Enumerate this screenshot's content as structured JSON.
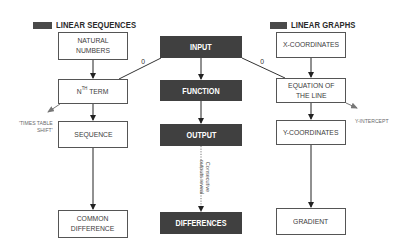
{
  "legend": {
    "left": {
      "label": "LINEAR SEQUENCES",
      "swatch_color": "#4a4a4a"
    },
    "right": {
      "label": "LINEAR GRAPHS",
      "swatch_color": "#4a4a4a"
    }
  },
  "colors": {
    "dark_box": "#404040",
    "line": "#222222",
    "light_border": "#555555",
    "annotation_text": "#6a6a6a"
  },
  "left_column": {
    "natural_numbers": "NATURAL\nNUMBERS",
    "nth_term_prefix": "N",
    "nth_term_sup": "TH",
    "nth_term_suffix": " TERM",
    "sequence": "SEQUENCE",
    "common_difference": "COMMON\nDIFFERENCE",
    "times_table_shift": "'TIMES TABLE\nSHIFT'"
  },
  "center_column": {
    "input": "INPUT",
    "function": "FUNCTION",
    "output": "OUTPUT",
    "differences": "DIFFERENCES",
    "consecutive_note": "Consecutive\noutputs reveal"
  },
  "right_column": {
    "x_coordinates": "X-COORDINATES",
    "equation_of_line": "EQUATION OF\nTHE LINE",
    "y_coordinates": "Y-COORDINATES",
    "gradient": "GRADIENT",
    "y_intercept": "Y-INTERCEPT"
  },
  "connectors": {
    "left_zero": "0",
    "right_zero": "0"
  }
}
